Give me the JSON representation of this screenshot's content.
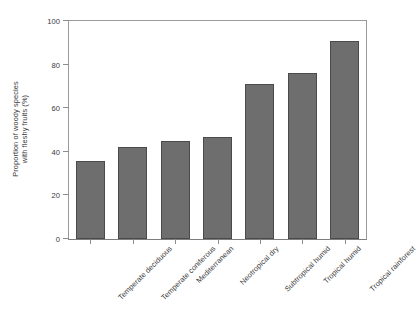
{
  "chart_data": {
    "type": "bar",
    "title": "",
    "subtitle": "",
    "xlabel": "",
    "ylabel": "Proportion of woody species with fleshy fruits (%)",
    "ylabel_lines": [
      "Proportion of woody species",
      "with fleshy fruits (%)"
    ],
    "categories": [
      "Temperate deciduous",
      "Temperate coniferous",
      "Mediterranean",
      "Neotropical dry",
      "Subtropical humid",
      "Tropical humid",
      "Tropical rainforest"
    ],
    "values": [
      36,
      42,
      45,
      47,
      71,
      76,
      91
    ],
    "ylim": [
      0,
      100
    ],
    "yticks": [
      0,
      20,
      40,
      60,
      80,
      100
    ],
    "ytick_labels": [
      "0",
      "20",
      "40",
      "60",
      "80",
      "100"
    ],
    "grid": false,
    "legend": false,
    "legend_position": "none",
    "bar_color": "#6e6e6e",
    "bar_edge_color": "#4a4a4a",
    "axis_color": "#8c8c8c",
    "text_color": "#3a3a3a",
    "background": "#ffffff"
  }
}
